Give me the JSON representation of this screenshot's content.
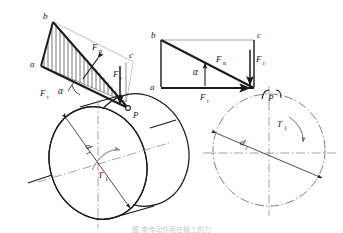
{
  "figure": {
    "title_caption": "图 带传动作用在轴上的力",
    "domain_note": "mechanical force decomposition diagram"
  },
  "left_view": {
    "name": "isometric-view",
    "vertices": {
      "a": "a",
      "b": "b",
      "c": "c"
    },
    "point_of_action": "P",
    "forces": {
      "normal": "F",
      "normal_sub": "n",
      "tangential": "F",
      "tangential_sub": "t",
      "radial": "F",
      "radial_sub": "r"
    },
    "angle": "α",
    "diameter": "d",
    "diameter_sub": "1",
    "torque": "T",
    "torque_sub": "1"
  },
  "right_view": {
    "name": "projected-view",
    "vertices": {
      "a": "a",
      "b": "b",
      "c": "c"
    },
    "point_of_action": "P",
    "forces": {
      "normal": "F",
      "normal_sub": "n",
      "tangential": "F",
      "tangential_sub": "t",
      "radial": "F",
      "radial_sub": "r"
    },
    "angle": "α",
    "diameter": "d",
    "diameter_sub": "1",
    "torque": "T",
    "torque_sub": "1"
  },
  "style": {
    "ink": "#1a1a1a",
    "thin": "#3a3a3a",
    "hatch": "#2b2b2b",
    "centerline": "#8a8a8a",
    "dash_circle": "#6f6f6f"
  }
}
